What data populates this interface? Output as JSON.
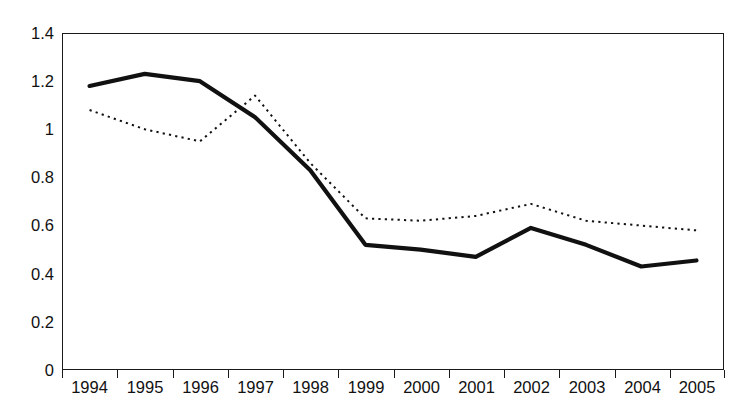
{
  "chart_data": {
    "type": "line",
    "title": "",
    "subtitle": "",
    "xlabel": "",
    "ylabel": "",
    "x": [
      "1994",
      "1995",
      "1996",
      "1997",
      "1998",
      "1999",
      "2000",
      "2001",
      "2002",
      "2003",
      "2004",
      "2005"
    ],
    "categories": [
      "1994",
      "1995",
      "1996",
      "1997",
      "1998",
      "1999",
      "2000",
      "2001",
      "2002",
      "2003",
      "2004",
      "2005"
    ],
    "ylim": [
      0,
      1.4
    ],
    "ytick_labels": [
      "0",
      "0.2",
      "0.4",
      "0.6",
      "0.8",
      "1",
      "1.2",
      "1.4"
    ],
    "ytick_values": [
      0,
      0.2,
      0.4,
      0.6,
      0.8,
      1.0,
      1.2,
      1.4
    ],
    "grid": false,
    "legend": "none",
    "legend_position": "none",
    "series": [
      {
        "name": "solid-series",
        "style": "solid",
        "color": "#111111",
        "line_width": 4.2,
        "values": [
          1.18,
          1.23,
          1.2,
          1.05,
          0.83,
          0.52,
          0.5,
          0.47,
          0.59,
          0.52,
          0.43,
          0.455
        ]
      },
      {
        "name": "dotted-series",
        "style": "dotted",
        "color": "#111111",
        "line_width": 2.0,
        "values": [
          1.08,
          1.0,
          0.95,
          1.14,
          0.86,
          0.63,
          0.62,
          0.64,
          0.69,
          0.62,
          0.6,
          0.58
        ]
      }
    ],
    "annotations": []
  },
  "axes": {
    "y_labels": [
      "1.4",
      "1.2",
      "1",
      "0.8",
      "0.6",
      "0.4",
      "0.2",
      "0"
    ],
    "x_labels": [
      "1994",
      "1995",
      "1996",
      "1997",
      "1998",
      "1999",
      "2000",
      "2001",
      "2002",
      "2003",
      "2004",
      "2005"
    ]
  },
  "colors": {
    "axis": "#1a1a1a",
    "series_solid": "#111111",
    "series_dotted": "#111111",
    "background": "#ffffff"
  }
}
